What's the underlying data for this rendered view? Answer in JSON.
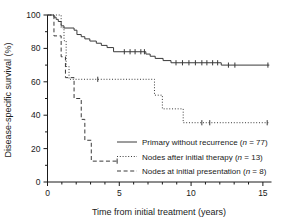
{
  "chart_data": {
    "type": "line",
    "title": "",
    "xlabel": "Time from initial treatment (years)",
    "ylabel": "Disease-specific survival (%)",
    "xlim": [
      0,
      15.6
    ],
    "ylim": [
      0,
      100
    ],
    "xticks": [
      0,
      5,
      10,
      15
    ],
    "xtick_labels": [
      "0",
      "5",
      "10",
      "15"
    ],
    "xminor_ticks": [
      1,
      2,
      3,
      4,
      6,
      7,
      8,
      9,
      11,
      12,
      13,
      14
    ],
    "yticks": [
      0,
      20,
      40,
      60,
      80,
      100
    ],
    "ytick_labels": [
      "0",
      "20",
      "40",
      "60",
      "80",
      "100"
    ],
    "yminor_ticks": [
      10,
      30,
      50,
      70,
      90
    ],
    "grid": false,
    "legend_position": "lower right",
    "series": [
      {
        "name": "Primary without recurrence",
        "n": 77,
        "style": "solid",
        "legend_label": "Primary without recurrence (n = 77)",
        "steps": [
          [
            0.0,
            100
          ],
          [
            0.45,
            100
          ],
          [
            0.45,
            98.7
          ],
          [
            0.6,
            98.7
          ],
          [
            0.6,
            97.4
          ],
          [
            0.75,
            97.4
          ],
          [
            0.75,
            96.1
          ],
          [
            0.95,
            96.1
          ],
          [
            0.95,
            93.5
          ],
          [
            1.15,
            93.5
          ],
          [
            1.15,
            92.2
          ],
          [
            1.85,
            92.2
          ],
          [
            1.85,
            90.9
          ],
          [
            2.05,
            90.9
          ],
          [
            2.05,
            88.3
          ],
          [
            2.35,
            88.3
          ],
          [
            2.35,
            87.0
          ],
          [
            2.6,
            87.0
          ],
          [
            2.6,
            85.7
          ],
          [
            2.95,
            85.7
          ],
          [
            2.95,
            84.4
          ],
          [
            3.4,
            84.4
          ],
          [
            3.4,
            83.1
          ],
          [
            3.75,
            83.1
          ],
          [
            3.75,
            81.8
          ],
          [
            4.15,
            81.8
          ],
          [
            4.15,
            80.5
          ],
          [
            4.6,
            80.5
          ],
          [
            4.6,
            78.0
          ],
          [
            6.85,
            78.0
          ],
          [
            6.85,
            76.6
          ],
          [
            7.15,
            76.6
          ],
          [
            7.15,
            75.3
          ],
          [
            7.5,
            75.3
          ],
          [
            7.5,
            74.0
          ],
          [
            8.05,
            74.0
          ],
          [
            8.05,
            72.7
          ],
          [
            8.6,
            72.7
          ],
          [
            8.6,
            71.4
          ],
          [
            12.1,
            71.4
          ],
          [
            12.1,
            70.0
          ],
          [
            15.45,
            70.0
          ]
        ],
        "censors": [
          [
            5.35,
            78.0
          ],
          [
            5.75,
            78.0
          ],
          [
            6.1,
            78.0
          ],
          [
            6.5,
            78.0
          ],
          [
            6.75,
            78.0
          ],
          [
            8.95,
            71.4
          ],
          [
            9.4,
            71.4
          ],
          [
            9.85,
            71.4
          ],
          [
            10.3,
            71.4
          ],
          [
            10.75,
            71.4
          ],
          [
            11.1,
            71.4
          ],
          [
            11.5,
            71.4
          ],
          [
            11.85,
            71.4
          ],
          [
            12.6,
            70.0
          ],
          [
            13.05,
            70.0
          ],
          [
            15.35,
            70.0
          ]
        ]
      },
      {
        "name": "Nodes after initial therapy",
        "n": 13,
        "style": "dotted",
        "legend_label": "Nodes after initial therapy (n = 13)",
        "steps": [
          [
            0.0,
            100
          ],
          [
            0.95,
            100
          ],
          [
            0.95,
            92.3
          ],
          [
            1.15,
            92.3
          ],
          [
            1.15,
            84.6
          ],
          [
            1.3,
            84.6
          ],
          [
            1.3,
            69.2
          ],
          [
            1.5,
            69.2
          ],
          [
            1.5,
            61.5
          ],
          [
            7.45,
            61.5
          ],
          [
            7.45,
            52.0
          ],
          [
            8.0,
            52.0
          ],
          [
            8.0,
            43.8
          ],
          [
            9.45,
            43.8
          ],
          [
            9.45,
            35.5
          ],
          [
            15.45,
            35.5
          ]
        ],
        "censors": [
          [
            3.5,
            61.5
          ],
          [
            10.75,
            35.5
          ],
          [
            11.3,
            35.5
          ],
          [
            15.3,
            35.5
          ]
        ]
      },
      {
        "name": "Nodes at initial presentation",
        "n": 8,
        "style": "dashed",
        "legend_label": "Nodes at initial presentation (n = 8)",
        "steps": [
          [
            0.0,
            100
          ],
          [
            0.45,
            100
          ],
          [
            0.45,
            87.5
          ],
          [
            0.95,
            87.5
          ],
          [
            0.95,
            75.0
          ],
          [
            1.25,
            75.0
          ],
          [
            1.25,
            62.5
          ],
          [
            1.85,
            62.5
          ],
          [
            1.85,
            50.0
          ],
          [
            2.35,
            50.0
          ],
          [
            2.35,
            37.5
          ],
          [
            2.6,
            37.5
          ],
          [
            2.6,
            25.0
          ],
          [
            3.05,
            25.0
          ],
          [
            3.05,
            12.5
          ],
          [
            4.95,
            12.5
          ]
        ],
        "censors": [
          [
            4.85,
            12.5
          ]
        ]
      }
    ]
  },
  "axes": {
    "x_title": "Time from initial treatment (years)",
    "y_title": "Disease-specific survival (%)"
  },
  "legend": {
    "entries": [
      {
        "label": "Primary without recurrence (",
        "italic": "n",
        "tail": " = 77)",
        "style": "solid"
      },
      {
        "label": "Nodes after initial therapy (",
        "italic": "n",
        "tail": " = 13)",
        "style": "dotted"
      },
      {
        "label": "Nodes at initial presentation (",
        "italic": "n",
        "tail": " = 8)",
        "style": "dashed"
      }
    ]
  }
}
